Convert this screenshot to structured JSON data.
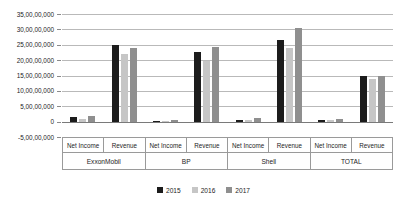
{
  "chart_data": {
    "type": "bar",
    "title": "",
    "xlabel": "",
    "ylabel": "",
    "ylim": [
      -50000000,
      350000000
    ],
    "grid": true,
    "legend_position": "bottom",
    "ytick_labels": [
      "35,00,00,000",
      "30,00,00,000",
      "25,00,00,000",
      "20,00,00,000",
      "15,00,00,000",
      "10,00,00,000",
      "5,00,00,000",
      "0",
      "-5,00,00,000"
    ],
    "ytick_values": [
      350000000,
      300000000,
      250000000,
      200000000,
      150000000,
      100000000,
      50000000,
      0,
      -50000000
    ],
    "companies": [
      "ExxonMobil",
      "BP",
      "Shell",
      "TOTAL"
    ],
    "metrics": [
      "Net Income",
      "Revenue"
    ],
    "categories": [
      "ExxonMobil Net Income",
      "ExxonMobil Revenue",
      "BP Net Income",
      "BP Revenue",
      "Shell Net Income",
      "Shell Revenue",
      "TOTAL Net Income",
      "TOTAL Revenue"
    ],
    "series": [
      {
        "name": "2015",
        "color": "#1c1c1c",
        "values": [
          16000000,
          250000000,
          3500000,
          225000000,
          4000000,
          265000000,
          5000000,
          148000000
        ]
      },
      {
        "name": "2016",
        "color": "#c6c6c6",
        "values": [
          8000000,
          220000000,
          2000000,
          198000000,
          5000000,
          238000000,
          6000000,
          140000000
        ]
      },
      {
        "name": "2017",
        "color": "#8f8f8f",
        "values": [
          19000000,
          240000000,
          4000000,
          243000000,
          13000000,
          305000000,
          7000000,
          150000000
        ]
      }
    ]
  },
  "legend": {
    "items": [
      {
        "label": "2015"
      },
      {
        "label": "2016"
      },
      {
        "label": "2017"
      }
    ]
  }
}
